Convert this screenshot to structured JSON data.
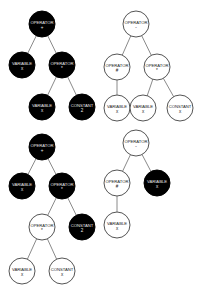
{
  "diagram": {
    "type": "expression-trees",
    "radius": 13,
    "colors": {
      "black_fill": "#000000",
      "white_fill": "#ffffff",
      "edge": "#8a8a8a"
    },
    "trees": [
      {
        "name": "tree-top-left",
        "nodes": [
          {
            "id": "t1n0",
            "kind": "OPERATOR",
            "value": "+",
            "fill": "black",
            "x": 42,
            "y": 24
          },
          {
            "id": "t1n1",
            "kind": "VARIABLE",
            "value": "x",
            "fill": "black",
            "x": 22,
            "y": 65
          },
          {
            "id": "t1n2",
            "kind": "OPERATOR",
            "value": "*",
            "fill": "black",
            "x": 62,
            "y": 65
          },
          {
            "id": "t1n3",
            "kind": "VARIABLE",
            "value": "x",
            "fill": "black",
            "x": 42,
            "y": 107
          },
          {
            "id": "t1n4",
            "kind": "CONSTANT",
            "value": "2",
            "fill": "black",
            "x": 82,
            "y": 107
          }
        ],
        "edges": [
          [
            "t1n0",
            "t1n1"
          ],
          [
            "t1n0",
            "t1n2"
          ],
          [
            "t1n2",
            "t1n3"
          ],
          [
            "t1n2",
            "t1n4"
          ]
        ]
      },
      {
        "name": "tree-top-right",
        "nodes": [
          {
            "id": "t2n0",
            "kind": "OPERATOR",
            "value": "-",
            "fill": "white",
            "x": 136,
            "y": 24
          },
          {
            "id": "t2n1",
            "kind": "OPERATOR",
            "value": "#",
            "fill": "white",
            "x": 117,
            "y": 67
          },
          {
            "id": "t2n2",
            "kind": "OPERATOR",
            "value": "*",
            "fill": "white",
            "x": 157,
            "y": 67
          },
          {
            "id": "t2n3",
            "kind": "VARIABLE",
            "value": "x",
            "fill": "white",
            "x": 117,
            "y": 108
          },
          {
            "id": "t2n4",
            "kind": "VARIABLE",
            "value": "x",
            "fill": "white",
            "x": 143,
            "y": 108
          },
          {
            "id": "t2n5",
            "kind": "CONSTANT",
            "value": "x",
            "fill": "white",
            "x": 180,
            "y": 108
          }
        ],
        "edges": [
          [
            "t2n0",
            "t2n1"
          ],
          [
            "t2n0",
            "t2n2"
          ],
          [
            "t2n1",
            "t2n3"
          ],
          [
            "t2n2",
            "t2n4"
          ],
          [
            "t2n2",
            "t2n5"
          ]
        ]
      },
      {
        "name": "tree-bottom-left",
        "nodes": [
          {
            "id": "t3n0",
            "kind": "OPERATOR",
            "value": "+",
            "fill": "black",
            "x": 42,
            "y": 147
          },
          {
            "id": "t3n1",
            "kind": "VARIABLE",
            "value": "x",
            "fill": "black",
            "x": 22,
            "y": 186
          },
          {
            "id": "t3n2",
            "kind": "OPERATOR",
            "value": "*",
            "fill": "black",
            "x": 62,
            "y": 186
          },
          {
            "id": "t3n3",
            "kind": "OPERATOR",
            "value": "*",
            "fill": "white",
            "x": 42,
            "y": 227
          },
          {
            "id": "t3n4",
            "kind": "CONSTANT",
            "value": "2",
            "fill": "black",
            "x": 82,
            "y": 227
          },
          {
            "id": "t3n5",
            "kind": "VARIABLE",
            "value": "x",
            "fill": "white",
            "x": 22,
            "y": 271
          },
          {
            "id": "t3n6",
            "kind": "CONSTANT",
            "value": "x",
            "fill": "white",
            "x": 62,
            "y": 271
          }
        ],
        "edges": [
          [
            "t3n0",
            "t3n1"
          ],
          [
            "t3n0",
            "t3n2"
          ],
          [
            "t3n2",
            "t3n3"
          ],
          [
            "t3n2",
            "t3n4"
          ],
          [
            "t3n3",
            "t3n5"
          ],
          [
            "t3n3",
            "t3n6"
          ]
        ]
      },
      {
        "name": "tree-bottom-right",
        "nodes": [
          {
            "id": "t4n0",
            "kind": "OPERATOR",
            "value": "-",
            "fill": "white",
            "x": 136,
            "y": 143
          },
          {
            "id": "t4n1",
            "kind": "OPERATOR",
            "value": "#",
            "fill": "white",
            "x": 117,
            "y": 183
          },
          {
            "id": "t4n2",
            "kind": "VARIABLE",
            "value": "x",
            "fill": "black",
            "x": 157,
            "y": 183
          },
          {
            "id": "t4n3",
            "kind": "VARIABLE",
            "value": "x",
            "fill": "white",
            "x": 117,
            "y": 225
          }
        ],
        "edges": [
          [
            "t4n0",
            "t4n1"
          ],
          [
            "t4n0",
            "t4n2"
          ],
          [
            "t4n1",
            "t4n3"
          ]
        ]
      }
    ]
  }
}
